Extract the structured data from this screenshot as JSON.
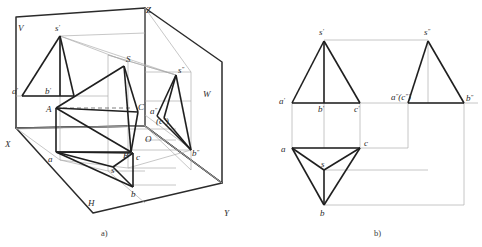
{
  "figure": {
    "title_a": "a)",
    "title_b": "b)"
  },
  "panel_a": {
    "caption": "a)",
    "planes": [
      {
        "name": "frontal-plane",
        "label": "V"
      },
      {
        "name": "horizontal-plane",
        "label": "H"
      },
      {
        "name": "profile-plane",
        "label": "W"
      }
    ],
    "axes": [
      {
        "name": "axis-x",
        "label": "X"
      },
      {
        "name": "axis-y",
        "label": "Y"
      },
      {
        "name": "axis-z",
        "label": "Z"
      },
      {
        "name": "origin",
        "label": "O"
      }
    ],
    "solid_vertices": [
      {
        "name": "vertex-S",
        "label": "S"
      },
      {
        "name": "vertex-A",
        "label": "A"
      },
      {
        "name": "vertex-B",
        "label": "B"
      },
      {
        "name": "vertex-C",
        "label": "C"
      }
    ],
    "front_projection": [
      {
        "name": "s-prime",
        "label": "s",
        "prime": "′"
      },
      {
        "name": "a-prime",
        "label": "a",
        "prime": "′"
      },
      {
        "name": "b-prime",
        "label": "b",
        "prime": "′"
      }
    ],
    "top_projection": [
      {
        "name": "s-top",
        "label": "s"
      },
      {
        "name": "a-top",
        "label": "a"
      },
      {
        "name": "b-top",
        "label": "b"
      },
      {
        "name": "c-top",
        "label": "c"
      }
    ],
    "side_projection": [
      {
        "name": "s-double-prime",
        "label": "s",
        "prime": "″"
      },
      {
        "name": "a-double-prime",
        "label": "a",
        "prime": "″"
      },
      {
        "name": "b-double-prime",
        "label": "b",
        "prime": "″"
      },
      {
        "name": "c-double-prime",
        "label": "(c",
        "prime": "″",
        "close": ")"
      }
    ]
  },
  "panel_b": {
    "caption": "b)",
    "front_view": {
      "name": "front-view",
      "apex": {
        "label": "s",
        "prime": "′"
      },
      "base": [
        {
          "label": "a",
          "prime": "′"
        },
        {
          "label": "b",
          "prime": "′"
        },
        {
          "label": "c",
          "prime": "′"
        }
      ]
    },
    "top_view": {
      "name": "top-view",
      "center": {
        "label": "s"
      },
      "corners": [
        {
          "label": "a"
        },
        {
          "label": "b"
        },
        {
          "label": "c"
        }
      ]
    },
    "side_view": {
      "name": "side-view",
      "apex": {
        "label": "s",
        "prime": "″"
      },
      "base_left": {
        "label": "a",
        "prime": "″",
        "hidden": "(c",
        "hidden_prime": "″",
        "hidden_close": ")"
      },
      "base_right": {
        "label": "b",
        "prime": "″"
      }
    }
  },
  "style": {
    "ink": "#2b2b2b",
    "thin": "#9a9a9a",
    "paper": "#ffffff"
  }
}
